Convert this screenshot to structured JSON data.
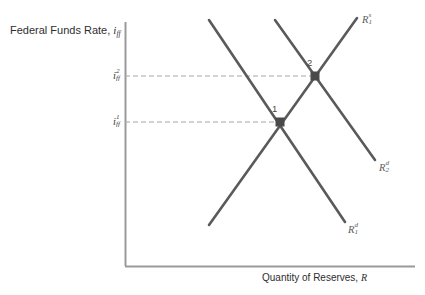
{
  "figure": {
    "type": "economics-supply-demand-diagram",
    "background_color": "#ffffff",
    "axis_color": "#9a9a9a",
    "curve_color": "#5a5a5a",
    "dashed_color": "#9a9a9a",
    "point_color": "#4a4a4a"
  },
  "axes": {
    "y_title_prefix": "Federal Funds Rate, ",
    "y_title_var": "i",
    "y_title_sub": "ff",
    "x_title_prefix": "Quantity of Reserves, ",
    "x_title_var": "R"
  },
  "ticks": [
    {
      "var": "i",
      "sub": "ff",
      "sup": "2",
      "y": 76
    },
    {
      "var": "i",
      "sub": "ff",
      "sup": "1",
      "y": 122
    }
  ],
  "curves": [
    {
      "name": "reserve-supply-1",
      "label_var": "R",
      "label_sub": "1",
      "label_sup": "s",
      "slope": "upward",
      "x1": 209,
      "y1": 225,
      "x2": 357,
      "y2": 18
    },
    {
      "name": "reserve-demand-1",
      "label_var": "R",
      "label_sub": "1",
      "label_sup": "d",
      "slope": "downward",
      "x1": 209,
      "y1": 20,
      "x2": 345,
      "y2": 222
    },
    {
      "name": "reserve-demand-2",
      "label_var": "R",
      "label_sub": "2",
      "label_sup": "d",
      "slope": "downward",
      "x1": 275,
      "y1": 20,
      "x2": 375,
      "y2": 160
    }
  ],
  "equilibria": [
    {
      "label": "1",
      "x": 280,
      "y": 122
    },
    {
      "label": "2",
      "x": 315,
      "y": 76
    }
  ],
  "dashed_guides": [
    {
      "name": "guide-i-ff-2",
      "x1": 125,
      "y": 76,
      "x2": 315
    },
    {
      "name": "guide-i-ff-1",
      "x1": 125,
      "y": 122,
      "x2": 280
    }
  ]
}
